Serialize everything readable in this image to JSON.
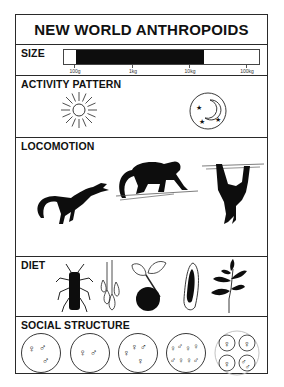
{
  "title": "NEW WORLD ANTHROPOIDS",
  "sections": {
    "size": {
      "label": "SIZE",
      "scale_ticks": [
        "100g",
        "1kg",
        "10kg",
        "100kg"
      ],
      "range_fill": {
        "from": "~100g",
        "to": "~15kg"
      },
      "fill_color": "#0d0d0d"
    },
    "activity": {
      "label": "ACTIVITY PATTERN",
      "icons": [
        "sun-icon (diurnal)",
        "moon-and-stars-icon (nocturnal)"
      ]
    },
    "locomotion": {
      "label": "LOCOMOTION",
      "icons": [
        "leaping-monkey-icon",
        "quadrupedal-monkey-icon",
        "suspensory-monkey-icon"
      ]
    },
    "diet": {
      "label": "DIET",
      "icons": [
        "insect-icon",
        "gum-exudate-icon",
        "fruit-icon",
        "seed-icon",
        "leaves-icon"
      ]
    },
    "social": {
      "label": "SOCIAL STRUCTURE",
      "groups": [
        {
          "name": "one female, multiple males",
          "symbols": [
            "♀",
            "♂",
            "♂"
          ]
        },
        {
          "name": "pair",
          "symbols": [
            "♀",
            "♂"
          ]
        },
        {
          "name": "one male, multiple females",
          "symbols": [
            "♀",
            "♀",
            "♂",
            "♀"
          ]
        },
        {
          "name": "multi-male multi-female",
          "symbols": [
            "♀",
            "♂",
            "♀",
            "♀",
            "♂",
            "♀",
            "♀",
            "♂"
          ]
        },
        {
          "name": "fission-fusion",
          "symbols": [
            "♀",
            "♀",
            "♀",
            "♂♂"
          ]
        }
      ]
    }
  }
}
